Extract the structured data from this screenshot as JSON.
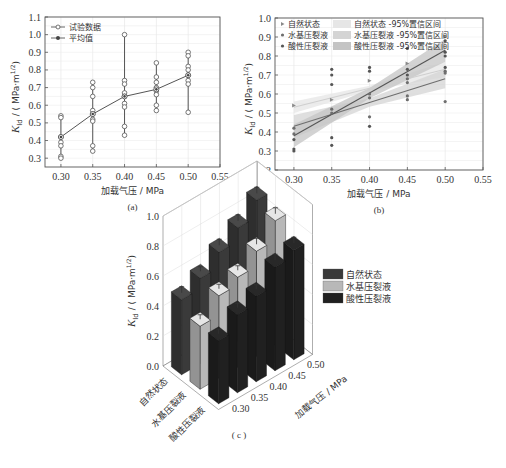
{
  "chart_data": [
    {
      "id": "a",
      "type": "scatter",
      "caption": "(a)",
      "title": "",
      "xlabel": "加载气压 / MPa",
      "ylabel_main": "K",
      "ylabel_sub": "Id",
      "ylabel_unit": " / ( MPa·m",
      "ylabel_exp": "1/2",
      "ylabel_close": ")",
      "xlim": [
        0.275,
        0.55
      ],
      "ylim": [
        0.25,
        1.1
      ],
      "xticks": [
        "0.30",
        "0.35",
        "0.40",
        "0.45",
        "0.50",
        "0.55"
      ],
      "xtick_values": [
        0.3,
        0.35,
        0.4,
        0.45,
        0.5,
        0.55
      ],
      "yticks": [
        "0.3",
        "0.4",
        "0.5",
        "0.6",
        "0.7",
        "0.8",
        "0.9",
        "1.0",
        "1.1"
      ],
      "ytick_values": [
        0.3,
        0.4,
        0.5,
        0.6,
        0.7,
        0.8,
        0.9,
        1.0,
        1.1
      ],
      "grid": true,
      "legend_position": "upper-left",
      "legend": [
        "试验数据",
        "平均值"
      ],
      "series": [
        {
          "name": "试验数据",
          "marker": "open-circle",
          "points": [
            [
              0.3,
              0.54
            ],
            [
              0.3,
              0.53
            ],
            [
              0.3,
              0.42
            ],
            [
              0.3,
              0.39
            ],
            [
              0.3,
              0.37
            ],
            [
              0.3,
              0.31
            ],
            [
              0.3,
              0.3
            ],
            [
              0.35,
              0.73
            ],
            [
              0.35,
              0.7
            ],
            [
              0.35,
              0.65
            ],
            [
              0.35,
              0.57
            ],
            [
              0.35,
              0.55
            ],
            [
              0.35,
              0.52
            ],
            [
              0.35,
              0.51
            ],
            [
              0.35,
              0.37
            ],
            [
              0.35,
              0.34
            ],
            [
              0.4,
              1.0
            ],
            [
              0.4,
              0.74
            ],
            [
              0.4,
              0.72
            ],
            [
              0.4,
              0.67
            ],
            [
              0.4,
              0.65
            ],
            [
              0.4,
              0.61
            ],
            [
              0.4,
              0.59
            ],
            [
              0.4,
              0.48
            ],
            [
              0.4,
              0.43
            ],
            [
              0.45,
              0.84
            ],
            [
              0.45,
              0.76
            ],
            [
              0.45,
              0.73
            ],
            [
              0.45,
              0.7
            ],
            [
              0.45,
              0.68
            ],
            [
              0.45,
              0.66
            ],
            [
              0.45,
              0.6
            ],
            [
              0.45,
              0.57
            ],
            [
              0.5,
              0.9
            ],
            [
              0.5,
              0.88
            ],
            [
              0.5,
              0.82
            ],
            [
              0.5,
              0.8
            ],
            [
              0.5,
              0.77
            ],
            [
              0.5,
              0.74
            ],
            [
              0.5,
              0.72
            ],
            [
              0.5,
              0.56
            ]
          ]
        },
        {
          "name": "平均值",
          "marker": "filled-circle-line",
          "x": [
            0.3,
            0.35,
            0.4,
            0.45,
            0.5
          ],
          "values": [
            0.42,
            0.55,
            0.65,
            0.69,
            0.77
          ]
        }
      ],
      "ranges": [
        {
          "x": 0.3,
          "min": 0.3,
          "max": 0.54
        },
        {
          "x": 0.35,
          "min": 0.34,
          "max": 0.73
        },
        {
          "x": 0.4,
          "min": 0.43,
          "max": 1.0
        },
        {
          "x": 0.45,
          "min": 0.57,
          "max": 0.84
        },
        {
          "x": 0.5,
          "min": 0.56,
          "max": 0.9
        }
      ]
    },
    {
      "id": "b",
      "type": "scatter",
      "caption": "(b)",
      "title": "",
      "xlabel": "加载气压 / MPa",
      "ylabel_main": "K",
      "ylabel_sub": "Id",
      "ylabel_unit": " / ( MPa·m",
      "ylabel_exp": "1/2",
      "ylabel_close": ")",
      "xlim": [
        0.275,
        0.55
      ],
      "ylim": [
        0.2,
        1.0
      ],
      "xticks": [
        "0.30",
        "0.35",
        "0.40",
        "0.45",
        "0.50",
        "0.55"
      ],
      "xtick_values": [
        0.3,
        0.35,
        0.4,
        0.45,
        0.5,
        0.55
      ],
      "yticks": [
        "0.2",
        "0.3",
        "0.4",
        "0.5",
        "0.6",
        "0.7",
        "0.8",
        "0.9",
        "1.0"
      ],
      "ytick_values": [
        0.2,
        0.3,
        0.4,
        0.5,
        0.6,
        0.7,
        0.8,
        0.9,
        1.0
      ],
      "grid": true,
      "legend_position": "upper-left",
      "legend": [
        "自然状态",
        "水基压裂液",
        "酸性压裂液",
        "自然状态 -95%置信区间",
        "水基压裂液 -95%置信区间",
        "酸性压裂液 -95%置信区间"
      ],
      "series": [
        {
          "name": "自然状态",
          "marker": "triangle-right",
          "color": "#8a8a8a",
          "points": [
            [
              0.3,
              0.54
            ],
            [
              0.35,
              0.57
            ],
            [
              0.4,
              0.67
            ],
            [
              0.45,
              0.76
            ],
            [
              0.5,
              0.9
            ]
          ],
          "fit": {
            "x": [
              0.3,
              0.5
            ],
            "y": [
              0.53,
              0.73
            ]
          },
          "band_color": "#e6e6e6",
          "band_halfwidth": [
            0.03,
            0.04
          ]
        },
        {
          "name": "水基压裂液",
          "marker": "dot",
          "color": "#6e6e6e",
          "points": [
            [
              0.3,
              0.42
            ],
            [
              0.3,
              0.39
            ],
            [
              0.35,
              0.52
            ],
            [
              0.35,
              0.5
            ],
            [
              0.4,
              0.6
            ],
            [
              0.4,
              0.58
            ],
            [
              0.4,
              0.48
            ],
            [
              0.45,
              0.68
            ],
            [
              0.45,
              0.66
            ],
            [
              0.45,
              0.59
            ],
            [
              0.45,
              0.57
            ],
            [
              0.5,
              0.72
            ],
            [
              0.5,
              0.71
            ],
            [
              0.5,
              0.56
            ]
          ],
          "fit": {
            "x": [
              0.3,
              0.5
            ],
            "y": [
              0.43,
              0.68
            ]
          },
          "band_color": "#d4d4d4",
          "band_halfwidth": [
            0.06,
            0.05
          ]
        },
        {
          "name": "酸性压裂液",
          "marker": "dot",
          "color": "#555555",
          "points": [
            [
              0.3,
              0.36
            ],
            [
              0.3,
              0.31
            ],
            [
              0.3,
              0.3
            ],
            [
              0.35,
              0.73
            ],
            [
              0.35,
              0.7
            ],
            [
              0.35,
              0.65
            ],
            [
              0.35,
              0.37
            ],
            [
              0.35,
              0.33
            ],
            [
              0.4,
              0.74
            ],
            [
              0.4,
              0.72
            ],
            [
              0.4,
              0.43
            ],
            [
              0.45,
              0.84
            ],
            [
              0.45,
              0.73
            ],
            [
              0.45,
              0.7
            ],
            [
              0.5,
              0.88
            ],
            [
              0.5,
              0.82
            ],
            [
              0.5,
              0.8
            ],
            [
              0.5,
              0.74
            ]
          ],
          "fit": {
            "x": [
              0.3,
              0.5
            ],
            "y": [
              0.38,
              0.83
            ]
          },
          "band_color": "#c4c4c4",
          "band_halfwidth": [
            0.06,
            0.06
          ]
        }
      ]
    },
    {
      "id": "c",
      "type": "bar",
      "subtype": "3d-bar",
      "caption": "( c )",
      "title": "",
      "xlabel": "",
      "ylabel": "加载气压 / MPa",
      "zlabel_main": "K",
      "zlabel_sub": "Id",
      "zlabel_unit": " / ( MPa·m",
      "zlabel_exp": "1/2",
      "zlabel_close": ")",
      "zlim": [
        0.0,
        1.0
      ],
      "zticks": [
        "0.0",
        "0.2",
        "0.4",
        "0.6",
        "0.8",
        "1.0"
      ],
      "categories": [
        "自然状态",
        "水基压裂液",
        "酸性压裂液"
      ],
      "pressures": [
        "0.30",
        "0.35",
        "0.40",
        "0.45",
        "0.50"
      ],
      "legend_position": "right",
      "legend": [
        "自然状态",
        "水基压裂液",
        "酸性压裂液"
      ],
      "colors": [
        "#3a3a3a",
        "#b8b8b8",
        "#202020"
      ],
      "series": [
        {
          "name": "自然状态",
          "values": [
            0.5,
            0.57,
            0.67,
            0.76,
            0.87
          ],
          "errors": [
            0.04,
            0.03,
            0.04,
            0.04,
            0.04
          ]
        },
        {
          "name": "水基压裂液",
          "values": [
            0.42,
            0.55,
            0.6,
            0.7,
            0.83
          ],
          "errors": [
            0.03,
            0.03,
            0.03,
            0.04,
            0.04
          ]
        },
        {
          "name": "酸性压裂液",
          "values": [
            0.42,
            0.52,
            0.57,
            0.69,
            0.73
          ],
          "errors": [
            0.03,
            0.03,
            0.03,
            0.04,
            0.04
          ]
        }
      ]
    }
  ]
}
